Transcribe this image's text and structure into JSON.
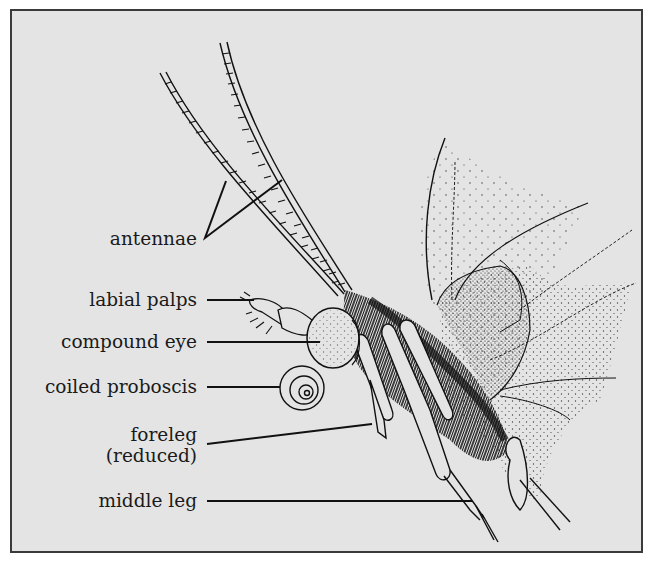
{
  "figure": {
    "background_color": "#e4e4e4",
    "border_color": "#3a3a3a",
    "ink_color": "#111111"
  },
  "labels": [
    {
      "id": "antennae",
      "text": "antennae"
    },
    {
      "id": "labial-palps",
      "text": "labial palps"
    },
    {
      "id": "compound-eye",
      "text": "compound eye"
    },
    {
      "id": "coiled-proboscis",
      "text": "coiled proboscis"
    },
    {
      "id": "foreleg",
      "text": "foreleg",
      "text2": "(reduced)"
    },
    {
      "id": "middle-leg",
      "text": "middle leg"
    }
  ]
}
